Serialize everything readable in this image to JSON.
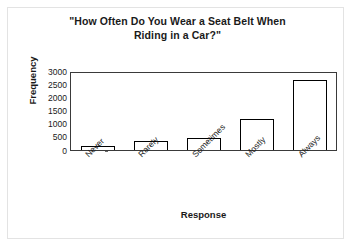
{
  "chart_data": {
    "type": "bar",
    "title": "\"How Often Do You Wear a Seat Belt When Riding in a Car?\"",
    "title_line1": "\"How Often Do You Wear a Seat Belt When",
    "title_line2": "Riding in a Car?\"",
    "xlabel": "Response",
    "ylabel": "Frequency",
    "categories": [
      "Never",
      "Rarely",
      "Sometimes",
      "Mostly",
      "Always"
    ],
    "values": [
      150,
      330,
      460,
      1180,
      2650
    ],
    "ylim": [
      0,
      3000
    ],
    "yticks": [
      0,
      500,
      1000,
      1500,
      2000,
      2500,
      3000
    ],
    "ytick_labels": [
      "0",
      "500",
      "1000",
      "1500",
      "2000",
      "2500",
      "3000"
    ],
    "grid": false,
    "legend": false,
    "bar_fill_color": "#ffffff",
    "bar_edge_color": "#000000",
    "axis_color": "#3a3a3a",
    "background_color": "#ffffff",
    "frame_color": "#e3e3e3"
  }
}
